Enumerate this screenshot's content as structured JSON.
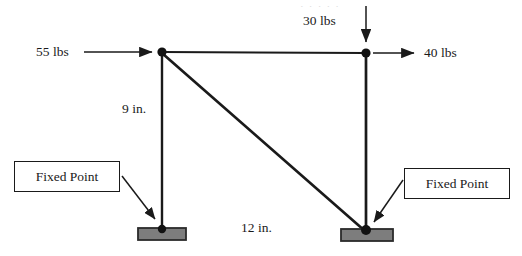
{
  "figure": {
    "type": "engineering-force-diagram",
    "canvas": {
      "width": 522,
      "height": 256
    },
    "colors": {
      "member": "#1a1a1a",
      "node": "#111111",
      "support_fill": "#7d7d7d",
      "support_border": "#2b2b2b",
      "text": "#1a1a1a",
      "background": "#ffffff"
    },
    "artifact_strip": "·   ·      ·   ·   ·"
  },
  "loads": [
    {
      "id": "load-left-horizontal",
      "label": "55 lbs",
      "magnitude": 55,
      "unit": "lbs",
      "direction": "right",
      "applied_at": "top-left-joint",
      "label_x": 36,
      "label_y": 46
    },
    {
      "id": "load-top-vertical",
      "label": "30 lbs",
      "magnitude": 30,
      "unit": "lbs",
      "direction": "down",
      "applied_at": "top-right-joint",
      "label_x": 303,
      "label_y": 14
    },
    {
      "id": "load-right-horizontal",
      "label": "40 lbs",
      "magnitude": 40,
      "unit": "lbs",
      "direction": "right",
      "applied_at": "top-right-joint",
      "label_x": 424,
      "label_y": 46
    }
  ],
  "dimensions": [
    {
      "id": "dimension-vertical",
      "label": "9 in.",
      "value": 9,
      "unit": "in.",
      "measures": "left vertical member height",
      "label_x": 122,
      "label_y": 103
    },
    {
      "id": "dimension-horizontal",
      "label": "12 in.",
      "value": 12,
      "unit": "in.",
      "measures": "span between supports",
      "label_x": 241,
      "label_y": 222
    }
  ],
  "callouts": [
    {
      "id": "callout-left",
      "label": "Fixed Point",
      "points_to": "left-support",
      "box": {
        "x": 14,
        "y": 161,
        "width": 106,
        "height": 31
      },
      "leader": {
        "x1": 122,
        "y1": 178,
        "x2": 157,
        "y2": 221
      }
    },
    {
      "id": "callout-right",
      "label": "Fixed Point",
      "points_to": "right-support",
      "box": {
        "x": 404,
        "y": 168,
        "width": 106,
        "height": 31
      },
      "leader": {
        "x1": 402,
        "y1": 180,
        "x2": 372,
        "y2": 224
      }
    }
  ],
  "joints": [
    {
      "id": "top-left-joint",
      "x": 162,
      "y": 52,
      "r": 4.6
    },
    {
      "id": "top-right-joint",
      "x": 366,
      "y": 53,
      "r": 4.6
    },
    {
      "id": "left-base-joint",
      "x": 162,
      "y": 230,
      "r": 4.2
    },
    {
      "id": "right-base-joint",
      "x": 366,
      "y": 231,
      "r": 4.6
    }
  ],
  "members": [
    {
      "id": "member-top-chord",
      "from": "top-left-joint",
      "to": "top-right-joint",
      "x1": 162,
      "y1": 52,
      "x2": 366,
      "y2": 53,
      "width": 1.9
    },
    {
      "id": "member-left-vertical",
      "from": "top-left-joint",
      "to": "left-base-joint",
      "x1": 162,
      "y1": 52,
      "x2": 162,
      "y2": 231,
      "width": 2.4
    },
    {
      "id": "member-right-vertical",
      "from": "top-right-joint",
      "to": "right-base-joint",
      "x1": 366,
      "y1": 53,
      "x2": 366,
      "y2": 232,
      "width": 2.6
    },
    {
      "id": "member-diagonal",
      "from": "top-left-joint",
      "to": "right-base-joint",
      "x1": 163,
      "y1": 54,
      "x2": 365,
      "y2": 231,
      "width": 2.6
    }
  ],
  "supports": [
    {
      "id": "left-support",
      "x": 138,
      "y": 228,
      "width": 48,
      "height": 12
    },
    {
      "id": "right-support",
      "x": 341,
      "y": 229,
      "width": 52,
      "height": 12
    }
  ],
  "arrows": {
    "load_left": {
      "x1": 84,
      "y1": 52,
      "x2": 158,
      "y2": 52
    },
    "load_top": {
      "x1": 366,
      "y1": 6,
      "x2": 366,
      "y2": 47
    },
    "load_right": {
      "x1": 372,
      "y1": 53,
      "x2": 420,
      "y2": 53
    }
  }
}
